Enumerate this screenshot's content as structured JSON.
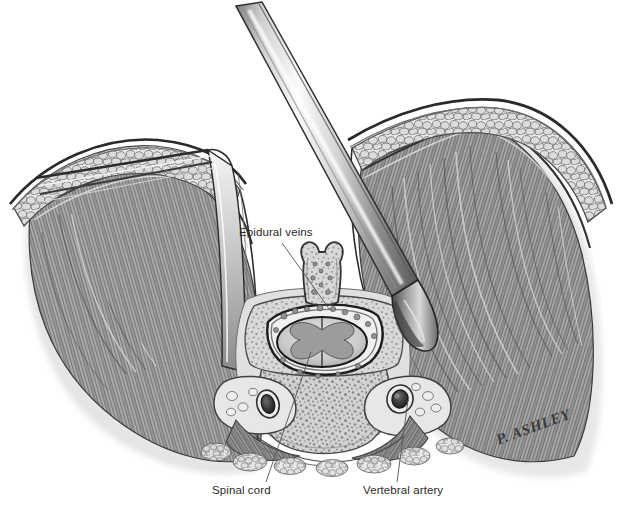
{
  "figure": {
    "width": 623,
    "height": 507,
    "background_color": "#ffffff",
    "medium": "grayscale pencil / wash medical illustration",
    "signature": "P. ASHLEY"
  },
  "labels": [
    {
      "id": "epidural-veins",
      "text": "Epidural veins",
      "x": 239,
      "y": 226,
      "leader_from": [
        282,
        243
      ],
      "leader_to": [
        330,
        310
      ]
    },
    {
      "id": "spinal-cord",
      "text": "Spinal cord",
      "x": 212,
      "y": 484,
      "leader_from": [
        266,
        482
      ],
      "leader_to": [
        311,
        352
      ]
    },
    {
      "id": "vertebral-artery",
      "text": "Vertebral artery",
      "x": 363,
      "y": 484,
      "leader_from": [
        397,
        482
      ],
      "leader_to": [
        408,
        399
      ]
    }
  ],
  "colors": {
    "ink": "#2b2b2b",
    "outline": "#1e1e1e",
    "muscle_mid": "#8d8d8d",
    "muscle_dark": "#5a5a5a",
    "muscle_light": "#c2c2c2",
    "fat_fill": "#e4e4e4",
    "fat_outline": "#6e6e6e",
    "bone_fill": "#cfcfcf",
    "bone_speckle": "#7d7d7d",
    "cord_fill": "#d6d6d6",
    "cord_gray_matter": "#9a9a9a",
    "vessel_dark": "#3a3a3a",
    "metal_light": "#f2f2f2",
    "metal_mid": "#b4b4b4",
    "metal_dark": "#4f4f4f",
    "leader_line": "#555555",
    "background": "#ffffff"
  },
  "structures": [
    {
      "name": "skin-surface-left",
      "side": "left",
      "type": "integument"
    },
    {
      "name": "skin-surface-right",
      "side": "right",
      "type": "integument"
    },
    {
      "name": "subcutaneous-fat-left",
      "side": "left",
      "type": "fat"
    },
    {
      "name": "subcutaneous-fat-right",
      "side": "right",
      "type": "fat"
    },
    {
      "name": "paraspinal-muscle-left",
      "side": "left",
      "type": "muscle"
    },
    {
      "name": "paraspinal-muscle-right",
      "side": "right",
      "type": "muscle"
    },
    {
      "name": "spinous-process",
      "side": "center",
      "type": "bone"
    },
    {
      "name": "lamina",
      "side": "center",
      "type": "bone"
    },
    {
      "name": "vertebral-body",
      "side": "center",
      "type": "bone"
    },
    {
      "name": "spinal-canal",
      "side": "center",
      "type": "canal"
    },
    {
      "name": "spinal-cord",
      "side": "center",
      "type": "neural"
    },
    {
      "name": "grey-matter-butterfly",
      "side": "center",
      "type": "neural"
    },
    {
      "name": "epidural-veins",
      "side": "center",
      "type": "vascular"
    },
    {
      "name": "vertebral-artery-left",
      "side": "left",
      "type": "vascular"
    },
    {
      "name": "vertebral-artery-right",
      "side": "right",
      "type": "vascular"
    },
    {
      "name": "transverse-foramen-left",
      "side": "left",
      "type": "bone"
    },
    {
      "name": "transverse-foramen-right",
      "side": "right",
      "type": "bone"
    }
  ],
  "instruments": [
    {
      "name": "retractor-blade-left",
      "description": "flat blade retractor holding left muscle flap",
      "orientation": "diagonal from upper-left"
    },
    {
      "name": "dissector-instrument",
      "description": "metallic periosteal elevator entering wound from top",
      "orientation": "diagonal from top-center to right paraspinal gutter"
    }
  ]
}
